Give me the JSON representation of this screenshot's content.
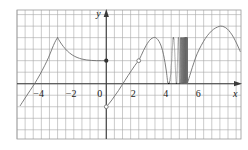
{
  "figure": {
    "kind": "cartesian-graph",
    "width": 248,
    "height": 150,
    "background": "#ffffff"
  },
  "axes": {
    "x_label": "x",
    "y_label": "y",
    "x_tick_labels": [
      "−4",
      "−2",
      "0",
      "2",
      "4",
      "6"
    ],
    "x_tick_values": [
      -4,
      -2,
      0,
      2,
      4,
      6
    ],
    "y_tick_labels": [],
    "x_range": [
      -5.5,
      8.3
    ],
    "y_range": [
      -2.4,
      3.2
    ],
    "axis_color": "#3a3a3a",
    "grid": true,
    "grid_color": "#a8a8a8",
    "grid_step": 0.5,
    "grid_x_range": [
      -5.5,
      8.3
    ],
    "grid_y_range": [
      -2.4,
      3.2
    ],
    "frame_color": "#9a9a9a"
  },
  "chart_data": {
    "type": "line",
    "title": "",
    "xlabel": "x",
    "ylabel": "y",
    "xlim": [
      -5.5,
      8.3
    ],
    "ylim": [
      -2.4,
      3.2
    ],
    "grid": true,
    "legend": "none",
    "curve_color": "#6e6e6e",
    "curve_width": 0.9,
    "series": [
      {
        "name": "rising-branch",
        "comment": "rises from lower-left to corner peak at x=-3",
        "points": [
          [
            -5.3,
            -0.95
          ],
          [
            -5.0,
            -0.62
          ],
          [
            -4.7,
            -0.3
          ],
          [
            -4.4,
            0.02
          ],
          [
            -4.1,
            0.38
          ],
          [
            -3.8,
            0.78
          ],
          [
            -3.55,
            1.15
          ],
          [
            -3.35,
            1.5
          ],
          [
            -3.18,
            1.78
          ],
          [
            -3.05,
            1.95
          ],
          [
            -3.0,
            2.0
          ]
        ]
      },
      {
        "name": "decaying-branch",
        "comment": "concave-up decay from corner peak to filled point at (0,1)",
        "points": [
          [
            -3.0,
            2.0
          ],
          [
            -2.85,
            1.82
          ],
          [
            -2.65,
            1.62
          ],
          [
            -2.4,
            1.42
          ],
          [
            -2.1,
            1.25
          ],
          [
            -1.8,
            1.14
          ],
          [
            -1.5,
            1.07
          ],
          [
            -1.2,
            1.03
          ],
          [
            -0.9,
            1.01
          ],
          [
            -0.6,
            1.0
          ],
          [
            -0.3,
            1.0
          ],
          [
            0.0,
            1.0
          ]
        ]
      },
      {
        "name": "steep-rise-branch",
        "comment": "from open circle at (0,-1) rising through x=1 to open circle at (2,1)",
        "points": [
          [
            0.0,
            -1.0
          ],
          [
            0.15,
            -0.88
          ],
          [
            0.35,
            -0.7
          ],
          [
            0.55,
            -0.5
          ],
          [
            0.75,
            -0.3
          ],
          [
            0.95,
            -0.08
          ],
          [
            1.15,
            0.14
          ],
          [
            1.35,
            0.36
          ],
          [
            1.55,
            0.57
          ],
          [
            1.75,
            0.78
          ],
          [
            1.9,
            0.92
          ],
          [
            2.0,
            1.0
          ]
        ]
      },
      {
        "name": "bump-branch",
        "comment": "continues from (2,1) to local max at (3,2) then down into oscillation",
        "points": [
          [
            2.0,
            1.0
          ],
          [
            2.15,
            1.22
          ],
          [
            2.3,
            1.45
          ],
          [
            2.45,
            1.65
          ],
          [
            2.6,
            1.82
          ],
          [
            2.75,
            1.94
          ],
          [
            2.9,
            2.0
          ],
          [
            3.0,
            2.01
          ],
          [
            3.1,
            1.97
          ],
          [
            3.25,
            1.84
          ],
          [
            3.4,
            1.6
          ],
          [
            3.52,
            1.28
          ],
          [
            3.62,
            0.92
          ],
          [
            3.7,
            0.55
          ],
          [
            3.76,
            0.2
          ],
          [
            3.8,
            0.0
          ]
        ]
      },
      {
        "name": "oscillation-branch",
        "comment": "sin(1/(5-x))-type oscillation with frequency increasing toward x=5, amplitude ~2, appearing as dense gray band from x~4.55 to x=5",
        "x_start": 3.8,
        "x_end": 5.0,
        "amplitude": 2.0,
        "baseline": 0.0,
        "frequency_law": "1/(5-x)",
        "solid_band_start": 4.55,
        "solid_band_end": 5.0,
        "band_color": "#8d8d8d",
        "band_top": 2.0,
        "band_bottom": 0.0
      },
      {
        "name": "arch-branch",
        "comment": "smooth arch resuming at x=5 rising to max at (7,2.5) then descending to right edge",
        "points": [
          [
            5.0,
            0.02
          ],
          [
            5.2,
            0.48
          ],
          [
            5.4,
            0.92
          ],
          [
            5.6,
            1.3
          ],
          [
            5.85,
            1.66
          ],
          [
            6.1,
            1.96
          ],
          [
            6.35,
            2.19
          ],
          [
            6.6,
            2.36
          ],
          [
            6.85,
            2.46
          ],
          [
            7.05,
            2.5
          ],
          [
            7.25,
            2.47
          ],
          [
            7.45,
            2.38
          ],
          [
            7.65,
            2.22
          ],
          [
            7.85,
            2.0
          ],
          [
            8.05,
            1.72
          ],
          [
            8.25,
            1.4
          ]
        ]
      }
    ],
    "markers": [
      {
        "name": "filled-point-0-1",
        "style": "filled",
        "x": 0.0,
        "y": 1.0,
        "color": "#333333",
        "comment": "closed dot: function value at x=0"
      },
      {
        "name": "open-point-0-neg1",
        "style": "open",
        "x": 0.0,
        "y": -1.0,
        "color": "#6e6e6e",
        "comment": "open circle: jump discontinuity from below"
      },
      {
        "name": "open-point-2-1",
        "style": "open",
        "x": 2.0,
        "y": 1.0,
        "color": "#6e6e6e",
        "comment": "open circle on the rising branch at x=2"
      }
    ]
  }
}
